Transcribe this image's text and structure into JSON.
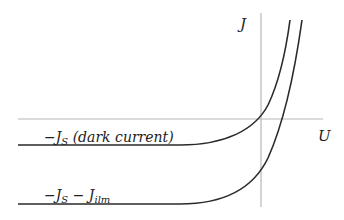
{
  "diagram": {
    "type": "solar-cell I-V characteristic",
    "axes": {
      "x_label": "U",
      "y_label": "J"
    },
    "curves": [
      {
        "name": "dark-current-curve",
        "label": "−J_S (dark current)",
        "label_main": "−J",
        "label_sub": "S",
        "label_rest": " (dark current)"
      },
      {
        "name": "illuminated-curve",
        "label": "−J_S − J_ilm",
        "label_main": "−J",
        "label_sub": "S",
        "label_mid": " − J",
        "label_sub2": "ilm"
      }
    ],
    "colors": {
      "axis": "#b8b8b8",
      "curve": "#2a2a2a",
      "text": "#222222"
    }
  }
}
